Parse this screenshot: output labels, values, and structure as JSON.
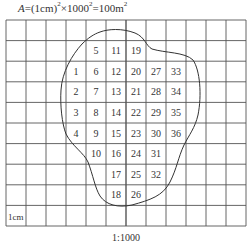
{
  "formula": {
    "symbol": "A",
    "text": "=(1cm)",
    "exp1": "2",
    "mid": "×1000",
    "exp2": "2",
    "equals": "=100m",
    "exp3": "2"
  },
  "grid": {
    "columns": 12,
    "rows": 10,
    "cell_size_label": "1cm",
    "line_color": "#555555",
    "origin": [
      6,
      20
    ],
    "cell_w": 20,
    "cell_h": 20.6
  },
  "cells": [
    {
      "n": "5",
      "col": 4,
      "row": 1
    },
    {
      "n": "11",
      "col": 5,
      "row": 1
    },
    {
      "n": "19",
      "col": 6,
      "row": 1
    },
    {
      "n": "1",
      "col": 3,
      "row": 2
    },
    {
      "n": "6",
      "col": 4,
      "row": 2
    },
    {
      "n": "12",
      "col": 5,
      "row": 2
    },
    {
      "n": "20",
      "col": 6,
      "row": 2
    },
    {
      "n": "27",
      "col": 7,
      "row": 2
    },
    {
      "n": "33",
      "col": 8,
      "row": 2
    },
    {
      "n": "2",
      "col": 3,
      "row": 3
    },
    {
      "n": "7",
      "col": 4,
      "row": 3
    },
    {
      "n": "13",
      "col": 5,
      "row": 3
    },
    {
      "n": "21",
      "col": 6,
      "row": 3
    },
    {
      "n": "28",
      "col": 7,
      "row": 3
    },
    {
      "n": "34",
      "col": 8,
      "row": 3
    },
    {
      "n": "3",
      "col": 3,
      "row": 4
    },
    {
      "n": "8",
      "col": 4,
      "row": 4
    },
    {
      "n": "14",
      "col": 5,
      "row": 4
    },
    {
      "n": "22",
      "col": 6,
      "row": 4
    },
    {
      "n": "29",
      "col": 7,
      "row": 4
    },
    {
      "n": "35",
      "col": 8,
      "row": 4
    },
    {
      "n": "4",
      "col": 3,
      "row": 5
    },
    {
      "n": "9",
      "col": 4,
      "row": 5
    },
    {
      "n": "15",
      "col": 5,
      "row": 5
    },
    {
      "n": "23",
      "col": 6,
      "row": 5
    },
    {
      "n": "30",
      "col": 7,
      "row": 5
    },
    {
      "n": "36",
      "col": 8,
      "row": 5
    },
    {
      "n": "10",
      "col": 4,
      "row": 6
    },
    {
      "n": "16",
      "col": 5,
      "row": 6
    },
    {
      "n": "24",
      "col": 6,
      "row": 6
    },
    {
      "n": "31",
      "col": 7,
      "row": 6
    },
    {
      "n": "17",
      "col": 5,
      "row": 7
    },
    {
      "n": "25",
      "col": 6,
      "row": 7
    },
    {
      "n": "32",
      "col": 7,
      "row": 7
    },
    {
      "n": "18",
      "col": 5,
      "row": 8
    },
    {
      "n": "26",
      "col": 6,
      "row": 8
    }
  ],
  "scale_label": "1:1000"
}
